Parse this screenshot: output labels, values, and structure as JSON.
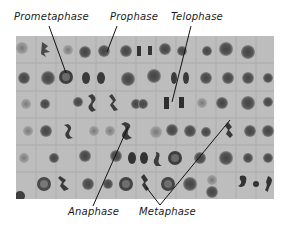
{
  "figure": {
    "colors": {
      "background": "#ffffff",
      "micrograph_bg": "#b9b9b9",
      "cell_wall": "#a6a6a6",
      "chromatin": "#3a3a3a",
      "label_text": "#1a1a1a",
      "leader_line": "#111111"
    },
    "labels_top": [
      {
        "id": "prometaphase",
        "text": "Prometaphase",
        "x": 2,
        "y": 11
      },
      {
        "id": "prophase",
        "text": "Prophase",
        "x": 110,
        "y": 11
      },
      {
        "id": "telophase",
        "text": "Telophase",
        "x": 170,
        "y": 11
      }
    ],
    "labels_bottom": [
      {
        "id": "anaphase",
        "text": "Anaphase",
        "x": 68,
        "y": 205
      },
      {
        "id": "metaphase",
        "text": "Metaphase",
        "x": 139,
        "y": 205
      }
    ],
    "leader_lines": [
      {
        "label": "Prometaphase",
        "x1": 49,
        "y1": 26,
        "x2": 66,
        "y2": 73
      },
      {
        "label": "Prophase",
        "x1": 117,
        "y1": 26,
        "x2": 107,
        "y2": 52
      },
      {
        "label": "Telophase",
        "x1": 191,
        "y1": 26,
        "x2": 172,
        "y2": 102
      },
      {
        "label": "Anaphase",
        "x1": 93,
        "y1": 206,
        "x2": 128,
        "y2": 127
      },
      {
        "label": "Metaphase-left",
        "x1": 160,
        "y1": 205,
        "x2": 146,
        "y2": 187
      },
      {
        "label": "Metaphase-right",
        "x1": 160,
        "y1": 205,
        "x2": 230,
        "y2": 120
      }
    ]
  }
}
